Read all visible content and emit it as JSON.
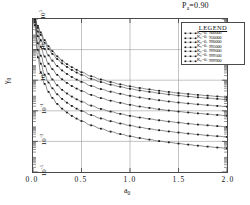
{
  "annotation": {
    "text": "P",
    "sub": "a",
    "value": "=0.90"
  },
  "axes": {
    "x": {
      "label": "a",
      "label_sub": "0",
      "ticks": [
        "0.0",
        "0.5",
        "1.0",
        "1.5",
        "2.0"
      ],
      "values": [
        0.0,
        0.5,
        1.0,
        1.5,
        2.0
      ],
      "lim": [
        0.0,
        2.0
      ]
    },
    "y": {
      "label": "γ",
      "label_sub": "0",
      "ticks": [
        "10",
        "10",
        "10",
        "10",
        "10",
        "10"
      ],
      "exponents": [
        "5",
        "3",
        "1",
        "-1",
        "-3",
        "-5"
      ],
      "values": [
        5,
        3,
        1,
        -1,
        -3,
        -5
      ],
      "lim": [
        -5,
        5
      ],
      "scale": "log"
    },
    "grid": true
  },
  "legend": {
    "title": "LEGEND",
    "position": "upper-right-inset",
    "entries": [
      {
        "label": "K",
        "sub": "c",
        "eq": "=0.",
        "value": "900000",
        "marker": "square"
      },
      {
        "label": "K",
        "sub": "c",
        "eq": "=0.",
        "value": "950000",
        "marker": "square"
      },
      {
        "label": "K",
        "sub": "c",
        "eq": "=0.",
        "value": "990000",
        "marker": "square"
      },
      {
        "label": "K",
        "sub": "c",
        "eq": "=0.",
        "value": "995000",
        "marker": "square"
      },
      {
        "label": "K",
        "sub": "c",
        "eq": "=0.",
        "value": "999000",
        "marker": "square"
      },
      {
        "label": "K",
        "sub": "c",
        "eq": "=0.",
        "value": "999500",
        "marker": "square"
      },
      {
        "label": "K",
        "sub": "c",
        "eq": "=0.",
        "value": "999900",
        "marker": "square"
      }
    ]
  },
  "colors": {
    "axis": "#4a4a4a",
    "grid": "#9a9a9a",
    "curve": "#555555",
    "marker": "#1a1a1a",
    "background": "#ffffff"
  },
  "chart_data": {
    "type": "line",
    "title": "",
    "xlabel": "a0",
    "ylabel": "gamma0",
    "xlim": [
      0.0,
      2.0
    ],
    "ylim": [
      -5,
      5
    ],
    "ylog": true,
    "grid": true,
    "legend_position": "upper-right-inset",
    "x": [
      0.02,
      0.05,
      0.08,
      0.12,
      0.16,
      0.2,
      0.25,
      0.3,
      0.35,
      0.4,
      0.45,
      0.5,
      0.6,
      0.7,
      0.8,
      0.9,
      1.0,
      1.1,
      1.2,
      1.3,
      1.4,
      1.5,
      1.6,
      1.7,
      1.8,
      1.9,
      2.0
    ],
    "series": [
      {
        "name": "Kc=0.900000",
        "log10_values": [
          5.0,
          4.55,
          4.12,
          3.62,
          3.22,
          2.9,
          2.56,
          2.28,
          2.05,
          1.85,
          1.68,
          1.52,
          1.26,
          1.05,
          0.88,
          0.73,
          0.6,
          0.49,
          0.4,
          0.31,
          0.23,
          0.16,
          0.1,
          0.04,
          -0.01,
          -0.06,
          -0.11
        ]
      },
      {
        "name": "Kc=0.950000",
        "log10_values": [
          5.0,
          4.42,
          3.96,
          3.45,
          3.04,
          2.72,
          2.38,
          2.1,
          1.87,
          1.67,
          1.5,
          1.35,
          1.09,
          0.88,
          0.71,
          0.57,
          0.44,
          0.33,
          0.24,
          0.15,
          0.07,
          0.0,
          -0.06,
          -0.12,
          -0.17,
          -0.22,
          -0.27
        ]
      },
      {
        "name": "Kc=0.990000",
        "log10_values": [
          5.0,
          4.18,
          3.62,
          3.05,
          2.62,
          2.28,
          1.93,
          1.64,
          1.41,
          1.21,
          1.04,
          0.89,
          0.63,
          0.42,
          0.25,
          0.11,
          -0.02,
          -0.13,
          -0.22,
          -0.31,
          -0.39,
          -0.46,
          -0.52,
          -0.58,
          -0.63,
          -0.68,
          -0.73
        ]
      },
      {
        "name": "Kc=0.995000",
        "log10_values": [
          5.0,
          3.88,
          3.18,
          2.55,
          2.08,
          1.72,
          1.35,
          1.06,
          0.82,
          0.62,
          0.45,
          0.3,
          0.04,
          -0.17,
          -0.34,
          -0.48,
          -0.61,
          -0.72,
          -0.81,
          -0.9,
          -0.98,
          -1.05,
          -1.11,
          -1.17,
          -1.22,
          -1.27,
          -1.32
        ]
      },
      {
        "name": "Kc=0.999000",
        "log10_values": [
          4.95,
          3.42,
          2.6,
          1.92,
          1.42,
          1.05,
          0.67,
          0.37,
          0.13,
          -0.07,
          -0.25,
          -0.4,
          -0.66,
          -0.88,
          -1.05,
          -1.2,
          -1.33,
          -1.44,
          -1.53,
          -1.62,
          -1.7,
          -1.77,
          -1.84,
          -1.9,
          -1.95,
          -2.0,
          -2.05
        ]
      },
      {
        "name": "Kc=0.999500",
        "log10_values": [
          4.8,
          2.98,
          2.08,
          1.36,
          0.85,
          0.47,
          0.08,
          -0.22,
          -0.47,
          -0.68,
          -0.86,
          -1.01,
          -1.28,
          -1.5,
          -1.68,
          -1.83,
          -1.96,
          -2.08,
          -2.18,
          -2.27,
          -2.35,
          -2.42,
          -2.49,
          -2.55,
          -2.61,
          -2.66,
          -2.71
        ]
      },
      {
        "name": "Kc=0.999900",
        "log10_values": [
          4.6,
          2.5,
          1.52,
          0.76,
          0.24,
          -0.16,
          -0.55,
          -0.86,
          -1.11,
          -1.33,
          -1.51,
          -1.67,
          -1.95,
          -2.17,
          -2.36,
          -2.52,
          -2.66,
          -2.78,
          -2.88,
          -2.98,
          -3.06,
          -3.14,
          -3.21,
          -3.28,
          -3.34,
          -3.4,
          -3.45
        ]
      }
    ]
  }
}
